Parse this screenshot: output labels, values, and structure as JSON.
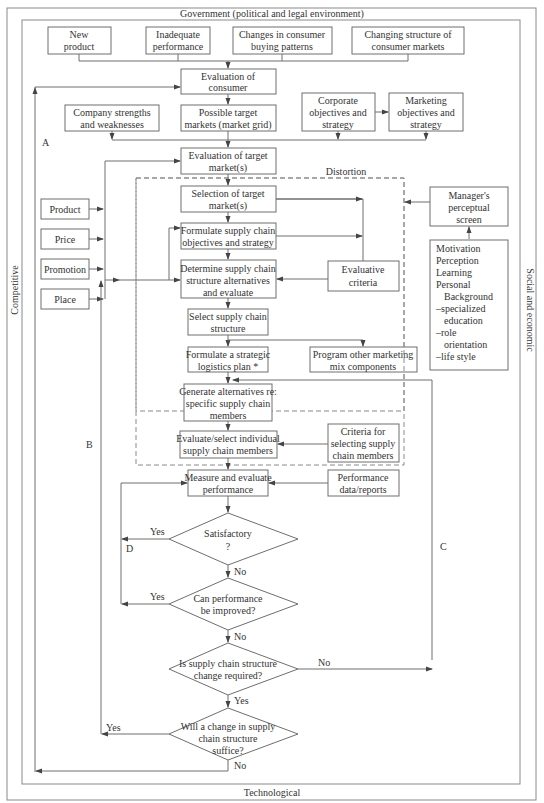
{
  "environment": {
    "top": "Government (political and legal environment)",
    "bottom": "Technological",
    "left": "Competitive",
    "right": "Social and economic"
  },
  "triggers": [
    [
      "New",
      "product"
    ],
    [
      "Inadequate",
      "performance"
    ],
    [
      "Changes in consumer",
      "buying patterns"
    ],
    [
      "Changing structure of",
      "consumer markets"
    ]
  ],
  "nodes": {
    "eval_consumer": [
      "Evaluation of",
      "consumer"
    ],
    "company_sw": [
      "Company strengths",
      "and weaknesses"
    ],
    "possible_targets": [
      "Possible target",
      "markets (market grid)"
    ],
    "corporate_obj": [
      "Corporate",
      "objectives and",
      "strategy"
    ],
    "marketing_obj": [
      "Marketing",
      "objectives and",
      "strategy"
    ],
    "eval_target": [
      "Evaluation of target",
      "market(s)"
    ],
    "selection_target": [
      "Selection of target",
      "market(s)"
    ],
    "formulate_sc": [
      "Formulate  supply chain",
      "objectives and strategy"
    ],
    "determine_sc": [
      "Determine supply chain",
      "structure alternatives",
      "and evaluate"
    ],
    "evaluative_criteria": [
      "Evaluative",
      "criteria"
    ],
    "select_sc": [
      "Select supply chain",
      "structure"
    ],
    "formulate_logistics": [
      "Formulate a strategic",
      "logistics plan *"
    ],
    "program_other": [
      "Program other marketing",
      "mix components"
    ],
    "generate_alt": [
      "Generate alternatives re:",
      "specific supply chain",
      "members"
    ],
    "evaluate_select": [
      "Evaluate/select individual",
      "supply chain members"
    ],
    "criteria_selecting": [
      "Criteria for",
      "selecting supply",
      "chain members"
    ],
    "measure_eval": [
      "Measure and evaluate",
      "performance"
    ],
    "performance_data": [
      "Performance",
      "data/reports"
    ],
    "managers_screen": [
      "Manager's",
      "perceptual",
      "screen"
    ],
    "perceptual_factors": [
      "Motivation",
      "Perception",
      "Learning",
      "Personal",
      "   Background",
      "–specialized",
      "  education",
      "–role",
      "  orientation",
      "–life style"
    ]
  },
  "marketing_mix": [
    "Product",
    "Price",
    "Promotion",
    "Place"
  ],
  "decisions": {
    "satisfactory": [
      "Satisfactory",
      "?"
    ],
    "can_improve": [
      "Can performance",
      "be improved?"
    ],
    "sc_change_required": [
      "Is supply chain structure",
      "change required?"
    ],
    "change_suffice": [
      "Will a change in supply",
      "chain structure",
      "suffice?"
    ]
  },
  "edge_labels": {
    "yes": "Yes",
    "no": "No",
    "distortion": "Distortion",
    "loop_a": "A",
    "loop_b": "B",
    "loop_c": "C",
    "loop_d": "D"
  }
}
